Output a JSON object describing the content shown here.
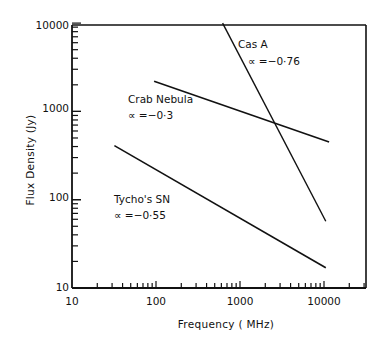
{
  "chart_data": {
    "type": "line",
    "title": "",
    "xlabel": "Frequency (MHz)",
    "ylabel": "Flux Density (Jy)",
    "xscale": "log",
    "yscale": "log",
    "xlim": [
      10,
      31600
    ],
    "ylim": [
      10,
      10000
    ],
    "grid": false,
    "legend": "none (inline annotations)",
    "x_ticks": [
      10,
      100,
      1000,
      10000
    ],
    "x_tick_labels": [
      "10",
      "100",
      "1000",
      "10000"
    ],
    "y_ticks": [
      10,
      100,
      1000,
      10000
    ],
    "y_tick_labels": [
      "10",
      "100",
      "1000",
      "10000"
    ],
    "series": [
      {
        "name": "Cas A",
        "spectral_index_label": "∝ =−0·76",
        "alpha": -0.76,
        "points": [
          [
            620,
            10000
          ],
          [
            10500,
            57
          ]
        ]
      },
      {
        "name": "Crab Nebula",
        "spectral_index_label": "∝ =−0·3",
        "alpha": -0.3,
        "points": [
          [
            95,
            2200
          ],
          [
            11500,
            450
          ]
        ]
      },
      {
        "name": "Tycho's SN",
        "spectral_index_label": "∝ =−0·55",
        "alpha": -0.55,
        "points": [
          [
            32,
            410
          ],
          [
            10500,
            17
          ]
        ]
      }
    ]
  },
  "labels": {
    "xlabel": "Frequency ( MHz)",
    "ylabel": "Flux  Density (Jy)",
    "x_ticks": [
      "10",
      "100",
      "1000",
      "10000"
    ],
    "y_ticks": [
      "10000",
      "1000",
      "100",
      "10"
    ],
    "cas_a_name": "Cas A",
    "cas_a_alpha": "∝ =−0·76",
    "crab_name": "Crab Nebula",
    "crab_alpha": "∝ =−0·3",
    "tycho_name": "Tycho's SN",
    "tycho_alpha": "∝ =−0·55"
  }
}
